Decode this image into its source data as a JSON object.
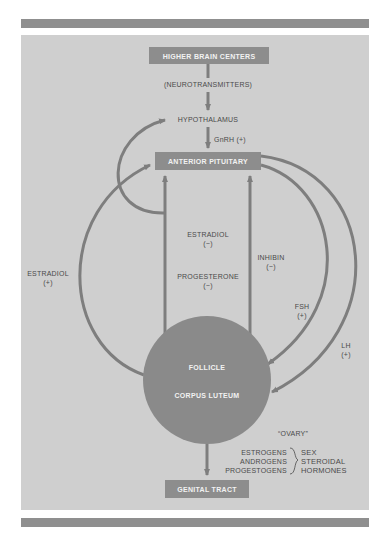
{
  "colors": {
    "background": "#ffffff",
    "panel": "#cfcfcf",
    "rule_bar": "#8f8f8f",
    "box_fill": "#8d8d8d",
    "arrow": "#7e7e7e",
    "circle": "#8a8a8a",
    "label_text": "#4a4a4a",
    "box_text": "#f2f2f2"
  },
  "nodes": {
    "higher_brain": "HIGHER BRAIN CENTERS",
    "neurotransmitters": "(NEUROTRANSMITTERS)",
    "hypothalamus": "HYPOTHALAMUS",
    "gnrh": "GnRH (+)",
    "anterior_pituitary": "ANTERIOR PITUITARY",
    "follicle": "FOLLICLE",
    "corpus_luteum": "CORPUS LUTEUM",
    "genital_tract": "GENITAL TRACT"
  },
  "feedback": {
    "estradiol_pos": {
      "name": "ESTRADIOL",
      "sign": "(+)"
    },
    "estradiol_neg": {
      "name": "ESTRADIOL",
      "sign": "(−)"
    },
    "progesterone": {
      "name": "PROGESTERONE",
      "sign": "(−)"
    },
    "inhibin": {
      "name": "INHIBIN",
      "sign": "(−)"
    },
    "fsh": {
      "name": "FSH",
      "sign": "(+)"
    },
    "lh": {
      "name": "LH",
      "sign": "(+)"
    }
  },
  "ovary": {
    "label": "“OVARY”",
    "hormones": [
      "ESTROGENS",
      "ANDROGENS",
      "PROGESTOGENS"
    ],
    "group": [
      "SEX",
      "STEROIDAL",
      "HORMONES"
    ]
  }
}
